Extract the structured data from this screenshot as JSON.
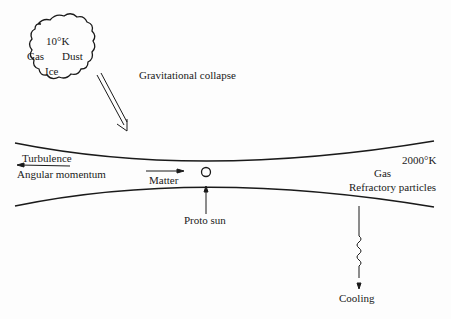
{
  "diagram": {
    "cloud": {
      "temperature": "10°K",
      "components": [
        "Gas",
        "Dust",
        "Ice"
      ]
    },
    "collapse_label": "Gravitational collapse",
    "disk": {
      "left_labels": {
        "turbulence": "Turbulence",
        "angular_momentum": "Angular momentum"
      },
      "matter_label": "Matter",
      "center_label": "Proto sun",
      "right_labels": {
        "temperature": "2000°K",
        "gas": "Gas",
        "particles": "Refractory particles"
      }
    },
    "cooling_label": "Cooling"
  }
}
